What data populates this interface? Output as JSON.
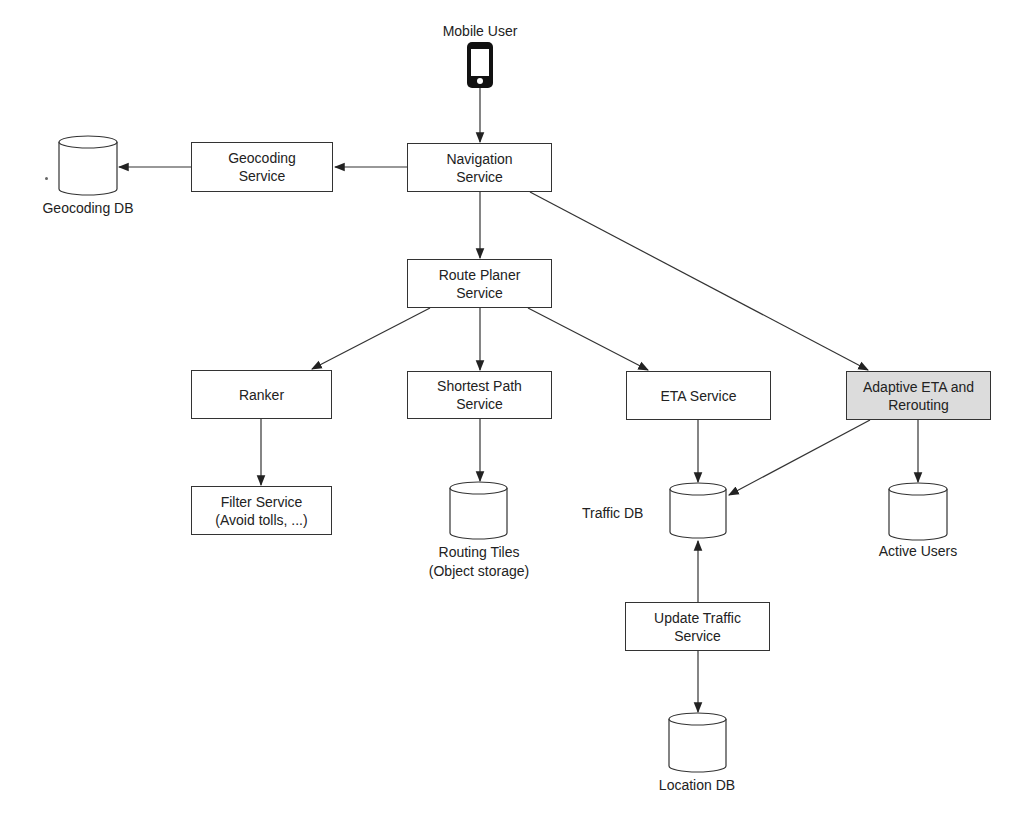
{
  "diagram": {
    "actor": {
      "label": "Mobile User",
      "icon": "mobile-phone-icon"
    },
    "services": [
      {
        "id": "navigation",
        "lines": [
          "Navigation",
          "Service"
        ]
      },
      {
        "id": "geocoding",
        "lines": [
          "Geocoding",
          "Service"
        ]
      },
      {
        "id": "route_planer",
        "lines": [
          "Route Planer",
          "Service"
        ]
      },
      {
        "id": "ranker",
        "lines": [
          "Ranker"
        ]
      },
      {
        "id": "shortest_path",
        "lines": [
          "Shortest Path",
          "Service"
        ]
      },
      {
        "id": "eta",
        "lines": [
          "ETA Service"
        ]
      },
      {
        "id": "adaptive_eta",
        "lines": [
          "Adaptive ETA and",
          "Rerouting"
        ],
        "highlighted": true,
        "fill": "#dcdcdc"
      },
      {
        "id": "filter",
        "lines": [
          "Filter Service",
          "(Avoid tolls, ...)"
        ]
      },
      {
        "id": "update_traffic",
        "lines": [
          "Update Traffic",
          "Service"
        ]
      }
    ],
    "databases": [
      {
        "id": "geocoding_db",
        "lines": [
          "Geocoding DB"
        ]
      },
      {
        "id": "routing_tiles",
        "lines": [
          "Routing Tiles",
          "(Object storage)"
        ]
      },
      {
        "id": "traffic_db",
        "lines": [
          "Traffic DB"
        ]
      },
      {
        "id": "active_users",
        "lines": [
          "Active Users"
        ]
      },
      {
        "id": "location_db",
        "lines": [
          "Location DB"
        ]
      }
    ],
    "edges": [
      {
        "from": "Mobile User",
        "to": "Navigation Service"
      },
      {
        "from": "Navigation Service",
        "to": "Geocoding Service"
      },
      {
        "from": "Geocoding Service",
        "to": "Geocoding DB"
      },
      {
        "from": "Navigation Service",
        "to": "Route Planer Service"
      },
      {
        "from": "Navigation Service",
        "to": "Adaptive ETA and Rerouting"
      },
      {
        "from": "Route Planer Service",
        "to": "Ranker"
      },
      {
        "from": "Route Planer Service",
        "to": "Shortest Path Service"
      },
      {
        "from": "Route Planer Service",
        "to": "ETA Service"
      },
      {
        "from": "Ranker",
        "to": "Filter Service"
      },
      {
        "from": "Shortest Path Service",
        "to": "Routing Tiles"
      },
      {
        "from": "ETA Service",
        "to": "Traffic DB"
      },
      {
        "from": "Adaptive ETA and Rerouting",
        "to": "Traffic DB"
      },
      {
        "from": "Adaptive ETA and Rerouting",
        "to": "Active Users"
      },
      {
        "from": "Update Traffic Service",
        "to": "Traffic DB"
      },
      {
        "from": "Update Traffic Service",
        "to": "Location DB"
      }
    ],
    "colors": {
      "stroke": "#333333",
      "highlight_fill": "#dcdcdc",
      "background": "#ffffff"
    }
  }
}
